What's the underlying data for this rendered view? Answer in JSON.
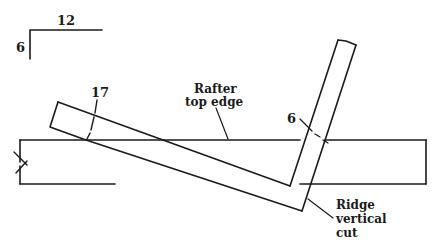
{
  "diagram": {
    "pitch_symbol": {
      "run_label": "12",
      "rise_label": "6"
    },
    "dimensions": {
      "left_mark": "17",
      "right_mark": "6"
    },
    "callouts": {
      "rafter_top_edge": {
        "line1": "Rafter",
        "line2": "top edge"
      },
      "ridge_vertical_cut": {
        "line1": "Ridge",
        "line2": "vertical",
        "line3": "cut"
      }
    },
    "colors": {
      "ink": "#1a1a1a",
      "background": "#ffffff"
    }
  }
}
